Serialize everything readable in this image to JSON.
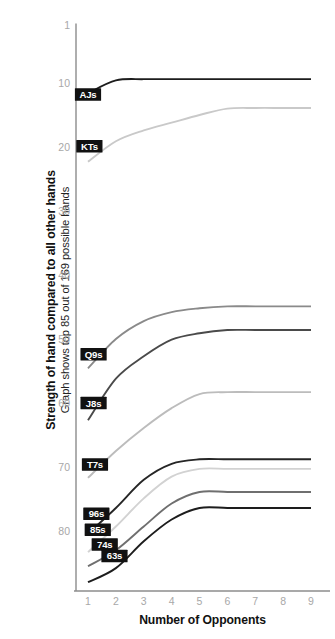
{
  "chart_data": {
    "type": "line",
    "title": "Strength of hand compared to all other hands",
    "subtitle": "Graph shows top 85 out of 169 possible hands",
    "xlabel": "Number of Opponents",
    "ylabel": "Strength of hand compared to all other hands",
    "x": [
      1,
      2,
      3,
      4,
      5,
      6,
      7,
      8,
      9
    ],
    "xticklabels": [
      "1",
      "2",
      "3",
      "4",
      "5",
      "6",
      "7",
      "8",
      "9"
    ],
    "yticks": [
      1,
      10,
      20,
      30,
      40,
      50,
      60,
      70,
      80
    ],
    "yticklabels": [
      "1",
      "10",
      "20",
      "30",
      "40",
      "50",
      "60",
      "70",
      "80"
    ],
    "ylim": [
      1,
      85
    ],
    "xlim": [
      1,
      9
    ],
    "y_axis_inverted": true,
    "grid": false,
    "legend": "inline-labels",
    "series": [
      {
        "name": "AJs",
        "color": "#1d1d1d",
        "values": [
          11.6,
          9.6,
          9.4,
          9.4,
          9.4,
          9.4,
          9.4,
          9.4,
          9.4
        ],
        "label_x": 1.0,
        "label_y": 11.8
      },
      {
        "name": "KTs",
        "color": "#c9c9c9",
        "values": [
          22.3,
          19.1,
          17.4,
          16.2,
          15.0,
          14.0,
          13.9,
          13.9,
          13.9
        ],
        "label_x": 1.05,
        "label_y": 19.9
      },
      {
        "name": "Q9s",
        "color": "#8a8a8a",
        "values": [
          54.6,
          50.0,
          47.2,
          45.8,
          45.2,
          44.9,
          44.9,
          44.9,
          44.9
        ],
        "label_x": 1.2,
        "label_y": 52.4
      },
      {
        "name": "J8s",
        "color": "#4a4a4a",
        "values": [
          62.7,
          56.2,
          52.7,
          50.1,
          49.1,
          48.6,
          48.6,
          48.6,
          48.6
        ],
        "label_x": 1.2,
        "label_y": 60.0
      },
      {
        "name": "T7s",
        "color": "#bcbcbc",
        "values": [
          71.7,
          67.5,
          63.9,
          60.8,
          58.6,
          58.3,
          58.3,
          58.3,
          58.3
        ],
        "label_x": 1.25,
        "label_y": 69.6
      },
      {
        "name": "96s",
        "color": "#262626",
        "values": [
          80.4,
          76.4,
          72.0,
          69.5,
          68.8,
          68.8,
          68.8,
          68.8,
          68.8
        ],
        "label_x": 1.3,
        "label_y": 77.3
      },
      {
        "name": "85s",
        "color": "#d2d2d2",
        "values": [
          83.3,
          79.3,
          74.9,
          71.5,
          70.3,
          70.3,
          70.3,
          70.3,
          70.3
        ],
        "label_x": 1.35,
        "label_y": 79.8
      },
      {
        "name": "74s",
        "color": "#6f6f6f",
        "values": [
          85.5,
          83.0,
          79.3,
          75.7,
          73.9,
          73.9,
          73.9,
          73.9,
          73.9
        ],
        "label_x": 1.6,
        "label_y": 82.1
      },
      {
        "name": "63s",
        "color": "#1d1d1d",
        "values": [
          88.0,
          85.8,
          81.6,
          78.2,
          76.4,
          76.4,
          76.4,
          76.4,
          76.4
        ],
        "label_x": 1.95,
        "label_y": 83.9
      }
    ]
  },
  "axis": {
    "x_title": "Number of Opponents",
    "y_title_main": "Strength of hand compared to all other hands",
    "y_title_sub": "Graph shows top 85 out of 169 possible hands"
  }
}
